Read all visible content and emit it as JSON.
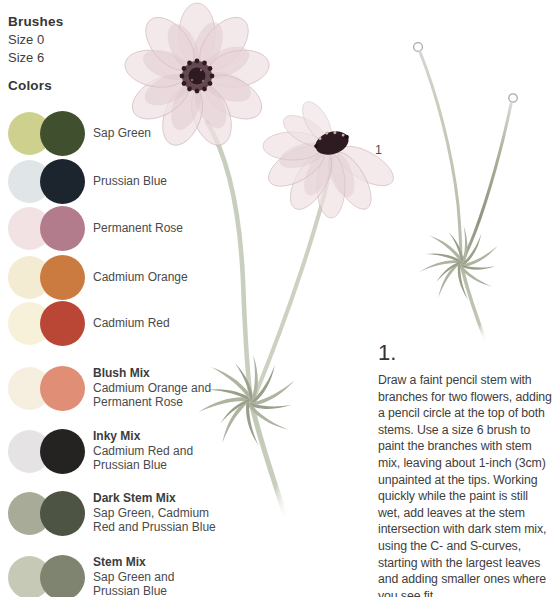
{
  "page": {
    "brushes_heading": "Brushes",
    "brush_sizes": [
      "Size 0",
      "Size 6"
    ],
    "colors_heading": "Colors"
  },
  "swatches": [
    {
      "name": "Sap Green",
      "desc": "",
      "light": "#cdd18d",
      "dark": "#40502e"
    },
    {
      "name": "Prussian Blue",
      "desc": "",
      "light": "#e0e5e7",
      "dark": "#1c242e"
    },
    {
      "name": "Permanent Rose",
      "desc": "",
      "light": "#f2e2e4",
      "dark": "#b27c8c"
    },
    {
      "name": "Cadmium Orange",
      "desc": "",
      "light": "#f4ecd2",
      "dark": "#cc7b40"
    },
    {
      "name": "Cadmium Red",
      "desc": "",
      "light": "#f7f1d9",
      "dark": "#ba4736"
    },
    {
      "name": "Blush Mix",
      "desc": "Cadmium Orange and Permanent Rose",
      "light": "#f6efe0",
      "dark": "#e08e75"
    },
    {
      "name": "Inky Mix",
      "desc": "Cadmium Red and Prussian Blue",
      "light": "#e6e3e4",
      "dark": "#242322"
    },
    {
      "name": "Dark Stem Mix",
      "desc": "Sap Green, Cadmium Red and Prussian Blue",
      "light": "#a7ab97",
      "dark": "#4d5443"
    },
    {
      "name": "Stem Mix",
      "desc": "Sap Green and Prussian Blue",
      "light": "#c5c9b6",
      "dark": "#7e846f"
    }
  ],
  "figure": {
    "label": "1"
  },
  "step": {
    "number": "1.",
    "text": "Draw a faint pencil stem with branches for two flowers, adding a pencil circle at the top of both stems. Use a size 6 brush to paint the branches with stem mix, leaving about 1-inch (3cm) unpainted at the tips. Working quickly while the paint is still wet, add leaves at the stem intersection with dark stem mix, using the C- and S-curves, starting with the largest leaves and adding smaller ones where you see fit."
  },
  "theme": {
    "petal": "#f0e2e5",
    "petal_deep": "#ddc6cb",
    "petal_edge": "#c9aeb4",
    "center_dark": "#2e1b22",
    "center_mid": "#553840",
    "stem": "#c6ccba",
    "leaf": "#aeb4a0",
    "leaf_dark": "#99a08a",
    "pencil": "#a9a9a9",
    "ink_text": "#3e3e3e"
  }
}
